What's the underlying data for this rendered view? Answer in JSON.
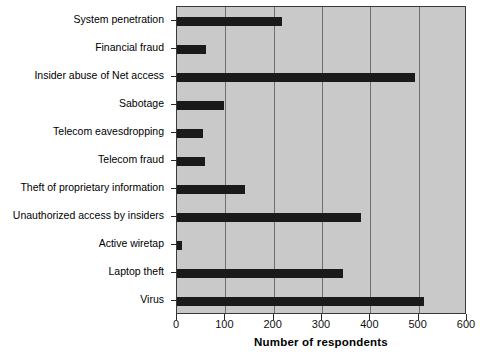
{
  "chart_data": {
    "type": "bar",
    "orientation": "horizontal",
    "title": "",
    "xlabel": "Number of respondents",
    "ylabel": "",
    "xlim": [
      0,
      600
    ],
    "xticks": [
      0,
      100,
      200,
      300,
      400,
      500,
      600
    ],
    "grid": true,
    "legend": "none",
    "bar_color": "#1a1a1a",
    "plot_background": "#c9c9c9",
    "gridline_color": "#6f6f6f",
    "categories": [
      "System penetration",
      "Financial fraud",
      "Insider abuse of Net access",
      "Sabotage",
      "Telecom eavesdropping",
      "Telecom fraud",
      "Theft of proprietary information",
      "Unauthorized access by insiders",
      "Active wiretap",
      "Laptop theft",
      "Virus"
    ],
    "values": [
      218,
      59,
      492,
      97,
      54,
      58,
      140,
      380,
      11,
      343,
      511
    ]
  }
}
